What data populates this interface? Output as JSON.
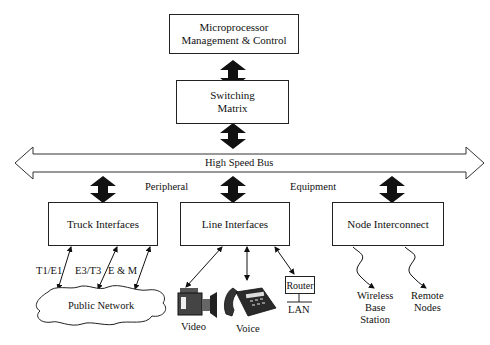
{
  "diagram": {
    "type": "block-diagram",
    "blocks": {
      "microprocessor": "Microprocessor Management & Control",
      "microprocessor_line1": "Microprocessor",
      "microprocessor_line2": "Management & Control",
      "switching_line1": "Switching",
      "switching_line2": "Matrix",
      "truck": "Truck Interfaces",
      "line": "Line Interfaces",
      "node": "Node Interconnect",
      "router": "Router"
    },
    "bus": {
      "label": "High Speed Bus"
    },
    "labels": {
      "peripheral": "Peripheral",
      "equipment": "Equipment",
      "t1e1": "T1/E1",
      "e3t3": "E3/T3",
      "em": "E & M",
      "public_network": "Public Network",
      "video": "Video",
      "voice": "Voice",
      "lan": "LAN",
      "wireless_line1": "Wireless",
      "wireless_line2": "Base",
      "wireless_line3": "Station",
      "remote_line1": "Remote",
      "remote_line2": "Nodes"
    },
    "colors": {
      "line": "#222222",
      "arrow_fill": "#111111",
      "background": "#ffffff"
    }
  }
}
